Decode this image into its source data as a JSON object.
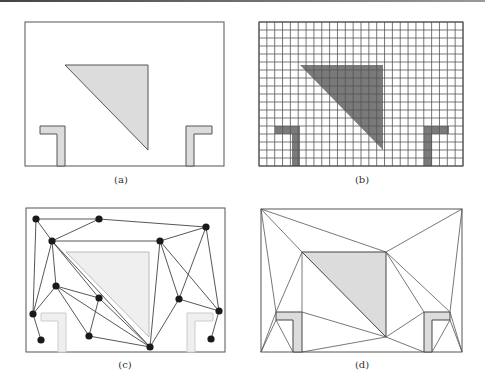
{
  "figure": {
    "colors": {
      "border": "#555555",
      "obstacle_fill": "#dcdcdc",
      "obstacle_fill_light": "#efefef",
      "obstacle_stroke": "#555555",
      "grid_line": "#555555",
      "grid_obstacle": "#777777",
      "node": "#1a1a1a",
      "edge": "#444444"
    },
    "panels": [
      {
        "id": "a",
        "caption": "(a)",
        "description": "workspace with obstacles"
      },
      {
        "id": "b",
        "caption": "(b)",
        "description": "cell decomposition grid",
        "grid": {
          "cols": 26,
          "rows": 18
        }
      },
      {
        "id": "c",
        "caption": "(c)",
        "description": "probabilistic roadmap",
        "nodes": [
          [
            36,
            219
          ],
          [
            99,
            219
          ],
          [
            52,
            241
          ],
          [
            160,
            241
          ],
          [
            206,
            227
          ],
          [
            56,
            286
          ],
          [
            99,
            298
          ],
          [
            33,
            314
          ],
          [
            41,
            340
          ],
          [
            89,
            336
          ],
          [
            150,
            347
          ],
          [
            179,
            299
          ],
          [
            219,
            311
          ],
          [
            211,
            339
          ]
        ],
        "edges": [
          [
            0,
            1
          ],
          [
            0,
            2
          ],
          [
            0,
            7
          ],
          [
            1,
            2
          ],
          [
            1,
            4
          ],
          [
            2,
            3
          ],
          [
            2,
            5
          ],
          [
            2,
            7
          ],
          [
            2,
            6
          ],
          [
            2,
            10
          ],
          [
            3,
            4
          ],
          [
            3,
            10
          ],
          [
            3,
            11
          ],
          [
            3,
            12
          ],
          [
            4,
            11
          ],
          [
            4,
            12
          ],
          [
            5,
            7
          ],
          [
            5,
            6
          ],
          [
            5,
            9
          ],
          [
            5,
            10
          ],
          [
            6,
            9
          ],
          [
            6,
            10
          ],
          [
            7,
            8
          ],
          [
            9,
            10
          ],
          [
            10,
            11
          ],
          [
            11,
            12
          ],
          [
            12,
            13
          ]
        ]
      },
      {
        "id": "d",
        "caption": "(d)",
        "description": "triangulated free space"
      }
    ]
  }
}
